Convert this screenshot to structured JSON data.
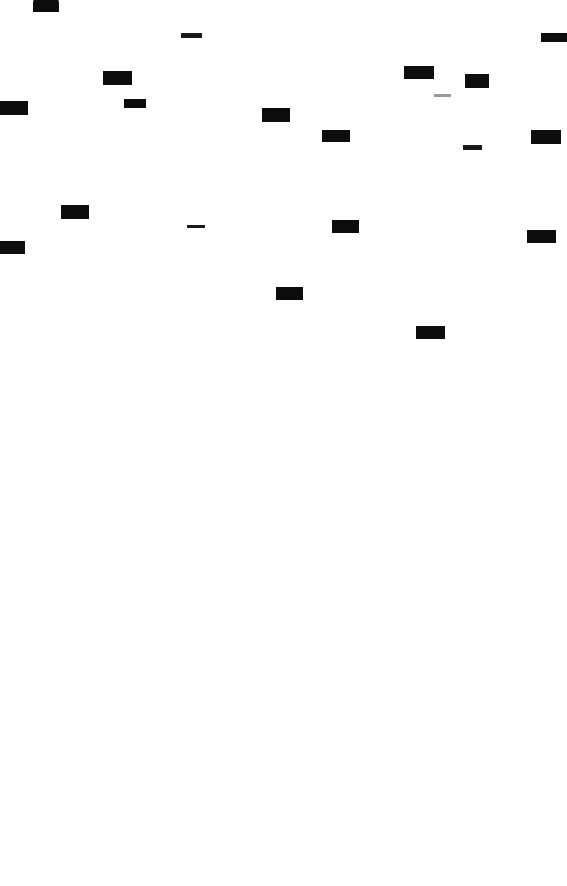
{
  "document": {
    "type": "redacted-document-page",
    "page_background": "#ffffff",
    "redaction_color": "#0d0d0d",
    "faint_mark_color": "#9a9a9a",
    "page_width": 567,
    "page_height": 886,
    "visible_text": "",
    "notes_label": "",
    "content_region_height": 360,
    "blank_region_height": 526,
    "redaction_count": 24
  },
  "redactions": [
    {
      "id": "block-01",
      "label": "",
      "x": 33,
      "y": -4,
      "w": 26,
      "h": 16,
      "style": "domed"
    },
    {
      "id": "block-02",
      "label": "",
      "x": 181,
      "y": 33,
      "w": 21,
      "h": 5,
      "style": "rule"
    },
    {
      "id": "block-03",
      "label": "",
      "x": 541,
      "y": 33,
      "w": 26,
      "h": 9,
      "style": "solid"
    },
    {
      "id": "block-04",
      "label": "",
      "x": 103,
      "y": 71,
      "w": 29,
      "h": 14,
      "style": "solid"
    },
    {
      "id": "block-05",
      "label": "",
      "x": 404,
      "y": 66,
      "w": 30,
      "h": 13,
      "style": "solid"
    },
    {
      "id": "block-06",
      "label": "",
      "x": 465,
      "y": 74,
      "w": 24,
      "h": 14,
      "style": "solid"
    },
    {
      "id": "block-07",
      "label": "",
      "x": 434,
      "y": 94,
      "w": 17,
      "h": 3,
      "style": "faint"
    },
    {
      "id": "block-08",
      "label": "",
      "x": 124,
      "y": 99,
      "w": 22,
      "h": 9,
      "style": "solid"
    },
    {
      "id": "block-09",
      "label": "",
      "x": -6,
      "y": 101,
      "w": 34,
      "h": 14,
      "style": "bleed-left"
    },
    {
      "id": "block-10",
      "label": "",
      "x": 262,
      "y": 108,
      "w": 28,
      "h": 14,
      "style": "solid"
    },
    {
      "id": "block-11",
      "label": "",
      "x": 322,
      "y": 130,
      "w": 28,
      "h": 12,
      "style": "solid"
    },
    {
      "id": "block-12",
      "label": "",
      "x": 531,
      "y": 130,
      "w": 30,
      "h": 14,
      "style": "solid"
    },
    {
      "id": "block-13",
      "label": "",
      "x": 463,
      "y": 145,
      "w": 19,
      "h": 5,
      "style": "rule"
    },
    {
      "id": "block-14",
      "label": "",
      "x": 61,
      "y": 205,
      "w": 28,
      "h": 14,
      "style": "solid"
    },
    {
      "id": "block-15",
      "label": "",
      "x": 187,
      "y": 225,
      "w": 18,
      "h": 3,
      "style": "rule"
    },
    {
      "id": "block-16",
      "label": "",
      "x": 332,
      "y": 220,
      "w": 27,
      "h": 13,
      "style": "solid"
    },
    {
      "id": "block-17",
      "label": "",
      "x": 527,
      "y": 230,
      "w": 29,
      "h": 13,
      "style": "solid"
    },
    {
      "id": "block-18",
      "label": "",
      "x": -6,
      "y": 241,
      "w": 31,
      "h": 13,
      "style": "bleed-left"
    },
    {
      "id": "block-19",
      "label": "",
      "x": 276,
      "y": 287,
      "w": 27,
      "h": 13,
      "style": "solid"
    },
    {
      "id": "block-20",
      "label": "",
      "x": 416,
      "y": 326,
      "w": 29,
      "h": 13,
      "style": "solid"
    }
  ]
}
